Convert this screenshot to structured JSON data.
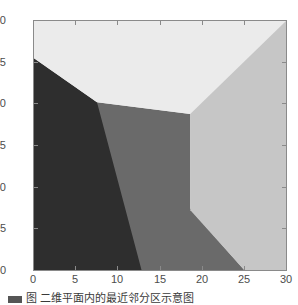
{
  "figure": {
    "title": "",
    "background": "#ffffff",
    "axis_color": "#8a8a8a",
    "label_color": "#4d4d4d"
  },
  "caption": {
    "text": "图  二维平面内的最近邻分区示意图",
    "visible": "partially-clipped"
  },
  "chart_data": {
    "type": "heatmap",
    "title": "",
    "xlabel": "",
    "ylabel": "",
    "xlim": [
      0,
      30
    ],
    "ylim": [
      0,
      30
    ],
    "xticks": [
      0,
      5,
      10,
      15,
      20,
      25,
      30
    ],
    "yticks": [
      0,
      5,
      10,
      15,
      20,
      25,
      30
    ],
    "xticklabels": [
      "0",
      "5",
      "10",
      "15",
      "20",
      "25",
      "30"
    ],
    "yticklabels": [
      "0",
      "5",
      "10",
      "15",
      "20",
      "25",
      "30"
    ],
    "grid": false,
    "legend": "none",
    "colormap": "gray",
    "regions": [
      {
        "name": "region-dark-lower-left",
        "label": "1",
        "color": "#2e2e2e",
        "value": 1,
        "polygon": [
          [
            0,
            0
          ],
          [
            0,
            25.5
          ],
          [
            7.5,
            20.2
          ],
          [
            25.0,
            0
          ]
        ]
      },
      {
        "name": "region-midgray-center",
        "label": "2",
        "color": "#6a6a6a",
        "value": 2,
        "polygon": [
          [
            7.5,
            20.2
          ],
          [
            18.6,
            18.8
          ],
          [
            18.6,
            7.2
          ],
          [
            25.0,
            0
          ],
          [
            12.8,
            0
          ]
        ]
      },
      {
        "name": "region-light-top",
        "label": "3",
        "color": "#ebebeb",
        "value": 3,
        "polygon": [
          [
            0,
            25.5
          ],
          [
            0,
            30
          ],
          [
            30,
            30
          ],
          [
            18.6,
            18.8
          ],
          [
            7.5,
            20.2
          ]
        ]
      },
      {
        "name": "region-lightgray-right",
        "label": "4",
        "color": "#c6c6c6",
        "value": 4,
        "polygon": [
          [
            18.6,
            18.8
          ],
          [
            30,
            30
          ],
          [
            30,
            0
          ],
          [
            25.0,
            0
          ],
          [
            18.6,
            7.2
          ]
        ]
      }
    ],
    "vertices": [
      {
        "name": "triple-junction-left",
        "x": 7.5,
        "y": 20.2
      },
      {
        "name": "triple-junction-center",
        "x": 18.6,
        "y": 18.8
      },
      {
        "name": "boundary-left-edge",
        "x": 0.0,
        "y": 25.5
      },
      {
        "name": "boundary-bottom-edge",
        "x": 25.0,
        "y": 0.0
      },
      {
        "name": "boundary-right-corner",
        "x": 30.0,
        "y": 30.0
      }
    ]
  }
}
